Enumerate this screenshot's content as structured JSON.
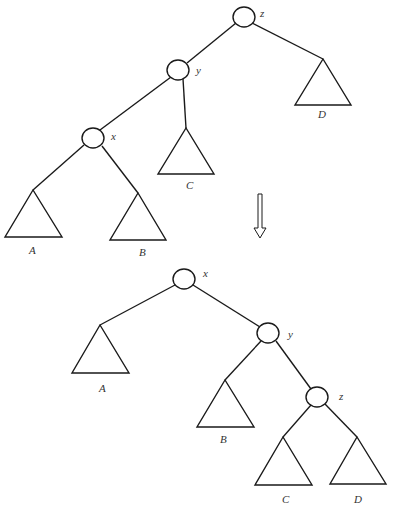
{
  "diagram": {
    "type": "tree-rotation",
    "before": {
      "nodes": [
        {
          "id": "z",
          "label": "z"
        },
        {
          "id": "y",
          "label": "y"
        },
        {
          "id": "x",
          "label": "x"
        }
      ],
      "subtrees": [
        {
          "id": "A",
          "label": "A"
        },
        {
          "id": "B",
          "label": "B"
        },
        {
          "id": "C",
          "label": "C"
        },
        {
          "id": "D",
          "label": "D"
        }
      ]
    },
    "after": {
      "nodes": [
        {
          "id": "x",
          "label": "x"
        },
        {
          "id": "y",
          "label": "y"
        },
        {
          "id": "z",
          "label": "z"
        }
      ],
      "subtrees": [
        {
          "id": "A",
          "label": "A"
        },
        {
          "id": "B",
          "label": "B"
        },
        {
          "id": "C",
          "label": "C"
        },
        {
          "id": "D",
          "label": "D"
        }
      ]
    },
    "arrow": {
      "direction": "down",
      "style": "hollow"
    }
  }
}
